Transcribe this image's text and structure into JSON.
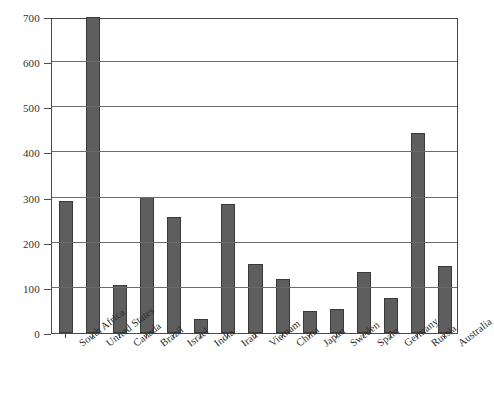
{
  "chart_data": {
    "type": "bar",
    "title": "",
    "subtitle": "",
    "xlabel": "",
    "ylabel": "",
    "ylim": [
      0,
      700
    ],
    "yticks": [
      0,
      100,
      200,
      300,
      400,
      500,
      600,
      700
    ],
    "ytick_labels": [
      "0",
      "100",
      "200",
      "300",
      "400",
      "500",
      "600",
      "700"
    ],
    "grid": "horizontal",
    "legend": "none",
    "categories": [
      "South Africa",
      "United States",
      "Canada",
      "Brazil",
      "Israel",
      "India",
      "Iran",
      "Vietnam",
      "China",
      "Japan",
      "Sweden",
      "Spain",
      "Germany",
      "Russia",
      "Australia"
    ],
    "values": [
      293,
      700,
      106,
      302,
      256,
      32,
      285,
      152,
      119,
      48,
      53,
      135,
      78,
      443,
      149
    ],
    "bar_color": "#5e5e5e",
    "bar_edge_color": "#3a3a3a",
    "grid_color": "#6b6b6b",
    "axis_color": "#4a4a4a",
    "background_color": "#ffffff",
    "tick_label_color": "#333333",
    "category_label_rotation": -38
  }
}
